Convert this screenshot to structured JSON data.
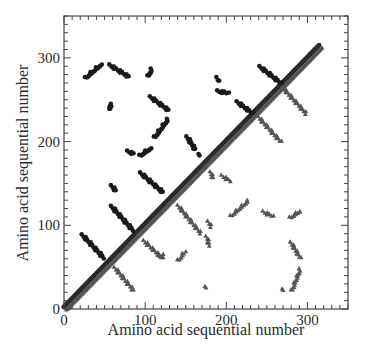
{
  "chart_data": {
    "type": "scatter",
    "title": "",
    "xlabel": "Amino acid sequential number",
    "ylabel": "Amino acid sequential number",
    "xlim": [
      0,
      350
    ],
    "ylim": [
      0,
      350
    ],
    "xticks": [
      0,
      100,
      200,
      300
    ],
    "yticks": [
      0,
      100,
      200,
      300
    ],
    "xtick_labels": [
      "0",
      "100",
      "200",
      "300"
    ],
    "ytick_labels": [
      "0",
      "100",
      "200",
      "300"
    ],
    "minor_tick_step": 10,
    "grid": false,
    "legend": "none",
    "colors": {
      "circle": "#1a1a1a",
      "triangle": "#555555",
      "diagonal": "#2b2b2b"
    },
    "series": [
      {
        "name": "diagonal",
        "marker": "circle",
        "segments": [
          {
            "from": [
              1,
              1
            ],
            "to": [
              316,
              314
            ]
          }
        ]
      },
      {
        "name": "upper-contacts",
        "marker": "circle",
        "segments": [
          {
            "from": [
              27,
              276
            ],
            "to": [
              46,
              292
            ]
          },
          {
            "from": [
              57,
              291
            ],
            "to": [
              79,
              278
            ]
          },
          {
            "from": [
              104,
              278
            ],
            "to": [
              108,
              286
            ]
          },
          {
            "from": [
              57,
              238
            ],
            "to": [
              57,
              245
            ]
          },
          {
            "from": [
              107,
              253
            ],
            "to": [
              128,
              238
            ]
          },
          {
            "from": [
              112,
              205
            ],
            "to": [
              128,
              226
            ]
          },
          {
            "from": [
              79,
              188
            ],
            "to": [
              85,
              186
            ]
          },
          {
            "from": [
              94,
              183
            ],
            "to": [
              107,
              192
            ]
          },
          {
            "from": [
              95,
              162
            ],
            "to": [
              121,
              140
            ]
          },
          {
            "from": [
              59,
              147
            ],
            "to": [
              63,
              142
            ]
          },
          {
            "from": [
              59,
              122
            ],
            "to": [
              85,
              94
            ]
          },
          {
            "from": [
              23,
              88
            ],
            "to": [
              49,
              61
            ]
          },
          {
            "from": [
              242,
              289
            ],
            "to": [
              267,
              270
            ]
          },
          {
            "from": [
              189,
              276
            ],
            "to": [
              190,
              272
            ]
          },
          {
            "from": [
              190,
              260
            ],
            "to": [
              202,
              258
            ]
          },
          {
            "from": [
              214,
              247
            ],
            "to": [
              232,
              234
            ]
          },
          {
            "from": [
              152,
              205
            ],
            "to": [
              162,
              190
            ]
          },
          {
            "from": [
              167,
              184
            ],
            "to": [
              167,
              184
            ]
          }
        ]
      },
      {
        "name": "lower-contacts",
        "marker": "triangle",
        "segments": [
          {
            "from": [
              99,
              81
            ],
            "to": [
              121,
              61
            ]
          },
          {
            "from": [
              63,
              49
            ],
            "to": [
              85,
              23
            ]
          },
          {
            "from": [
              141,
              123
            ],
            "to": [
              168,
              91
            ]
          },
          {
            "from": [
              206,
              111
            ],
            "to": [
              227,
              129
            ]
          },
          {
            "from": [
              178,
              104
            ],
            "to": [
              181,
              99
            ]
          },
          {
            "from": [
              176,
              86
            ],
            "to": [
              179,
              76
            ]
          },
          {
            "from": [
              141,
              58
            ],
            "to": [
              149,
              68
            ]
          },
          {
            "from": [
              119,
              62
            ],
            "to": [
              121,
              65
            ]
          },
          {
            "from": [
              246,
              116
            ],
            "to": [
              257,
              111
            ]
          },
          {
            "from": [
              175,
              26
            ],
            "to": [
              175,
              26
            ]
          },
          {
            "from": [
              279,
              109
            ],
            "to": [
              291,
              117
            ]
          },
          {
            "from": [
              280,
              79
            ],
            "to": [
              291,
              61
            ]
          },
          {
            "from": [
              281,
              22
            ],
            "to": [
              291,
              47
            ]
          },
          {
            "from": [
              270,
              23
            ],
            "to": [
              270,
              23
            ]
          },
          {
            "from": [
              270,
              264
            ],
            "to": [
              298,
              234
            ]
          },
          {
            "from": [
              240,
              229
            ],
            "to": [
              267,
              200
            ]
          },
          {
            "from": [
              181,
              163
            ],
            "to": [
              183,
              157
            ]
          },
          {
            "from": [
              195,
              159
            ],
            "to": [
              205,
              153
            ]
          }
        ]
      }
    ]
  }
}
